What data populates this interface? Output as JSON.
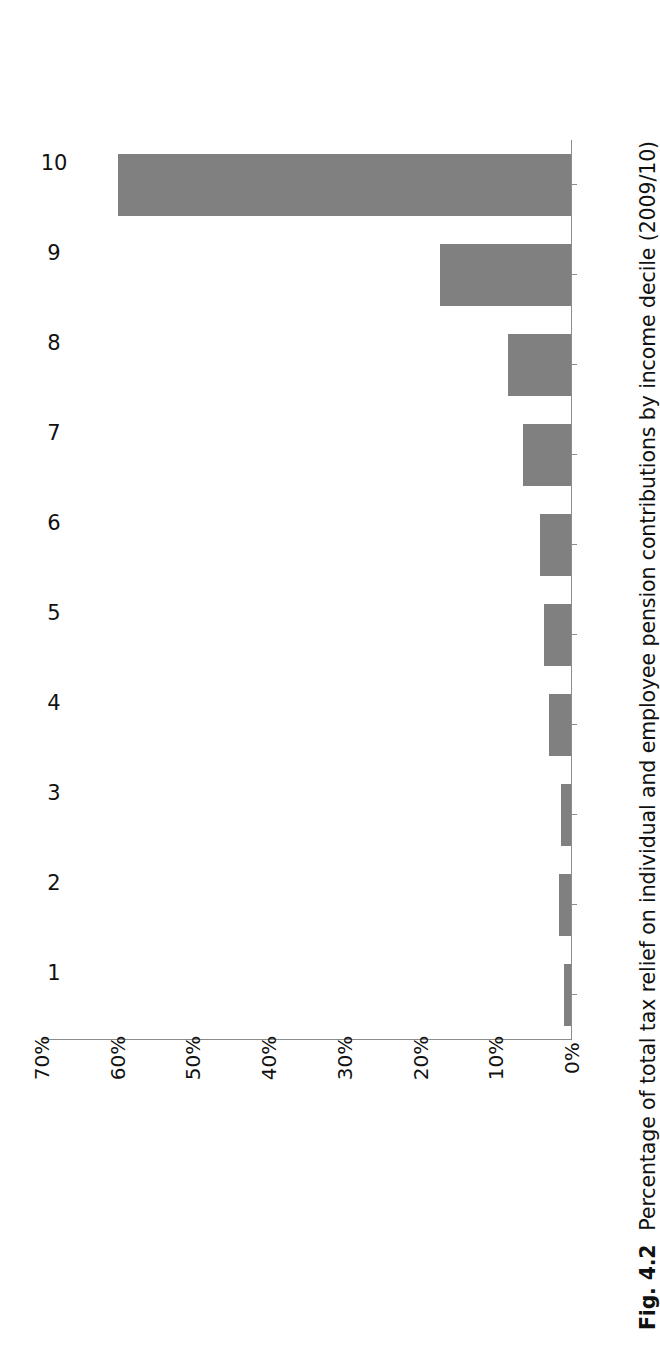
{
  "figure": {
    "number_label": "Fig. 4.2",
    "caption": "Percentage of total tax relief on individual and employee pension contributions by income decile (2009/10)"
  },
  "chart_data": {
    "type": "bar",
    "orientation": "horizontal",
    "title": "",
    "xlabel": "",
    "ylabel": "",
    "categories": [
      "1",
      "2",
      "3",
      "4",
      "5",
      "6",
      "7",
      "8",
      "9",
      "10"
    ],
    "values": [
      1,
      1.7,
      1.5,
      3,
      3.7,
      4.2,
      6.5,
      8.5,
      17.5,
      60
    ],
    "value_tick_labels": [
      "70%",
      "60%",
      "50%",
      "40%",
      "30%",
      "20%",
      "10%",
      "0%"
    ],
    "value_ticks": [
      70,
      60,
      50,
      40,
      30,
      20,
      10,
      0
    ],
    "ylim": [
      0,
      70
    ],
    "grid": false,
    "legend": false,
    "bar_color": "#808080",
    "axis_color": "#8c8c8c",
    "units": "percent"
  }
}
